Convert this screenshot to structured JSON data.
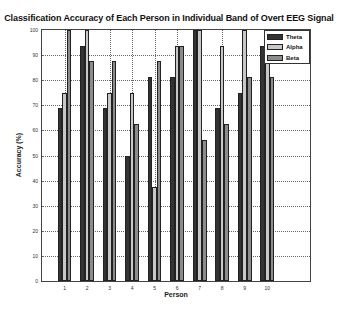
{
  "chart_data": {
    "type": "bar",
    "title": "Classification Accuracy of Each Person in Individual Band of Overt EEG Signal",
    "xlabel": "Person",
    "ylabel": "Accuracy (%)",
    "categories": [
      "1",
      "2",
      "3",
      "4",
      "5",
      "6",
      "7",
      "8",
      "9",
      "10"
    ],
    "series": [
      {
        "name": "Theta",
        "color": "#333333",
        "values": [
          68.75,
          93.75,
          68.75,
          50,
          81.25,
          81.25,
          100,
          68.75,
          75,
          93.75
        ]
      },
      {
        "name": "Alpha",
        "color": "#c8c8c8",
        "values": [
          75,
          100,
          75,
          75,
          37.5,
          93.75,
          100,
          93.75,
          100,
          100
        ]
      },
      {
        "name": "Beta",
        "color": "#8c8c8c",
        "values": [
          100,
          87.5,
          87.5,
          62.5,
          87.5,
          93.75,
          56.25,
          62.5,
          81.25,
          81.25
        ]
      }
    ],
    "ylim": [
      0,
      100
    ],
    "xlim": [
      0,
      11.9
    ],
    "yticks": [
      0,
      10,
      20,
      30,
      40,
      50,
      60,
      70,
      80,
      90,
      100
    ],
    "xticks": [
      1,
      2,
      3,
      4,
      5,
      6,
      7,
      8,
      9,
      10
    ],
    "grid": true,
    "legend_position": "upper right"
  },
  "labels": {
    "title": "Classification Accuracy of Each Person in Individual Band of Overt EEG Signal",
    "xlabel": "Person",
    "ylabel": "Accuracy (%)",
    "legend": [
      "Theta",
      "Alpha",
      "Beta"
    ]
  }
}
